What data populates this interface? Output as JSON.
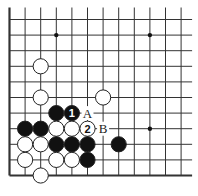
{
  "board": {
    "origin_x": 9.5,
    "origin_y": 19.5,
    "spacing": 15.6,
    "columns": 12,
    "rows": 11,
    "left_edge": true,
    "bottom_edge": true,
    "line_extend_top": 12,
    "line_extend_right": 11,
    "stone_radius": 7.6,
    "star_points": [
      {
        "c": 3,
        "r": 1
      },
      {
        "c": 9,
        "r": 1
      },
      {
        "c": 9,
        "r": 7
      }
    ],
    "stones": [
      {
        "c": 2,
        "r": 3,
        "color": "white"
      },
      {
        "c": 2,
        "r": 5,
        "color": "white"
      },
      {
        "c": 6,
        "r": 5,
        "color": "white"
      },
      {
        "c": 3,
        "r": 6,
        "color": "black"
      },
      {
        "c": 4,
        "r": 6,
        "color": "black",
        "label": "1"
      },
      {
        "c": 1,
        "r": 7,
        "color": "black"
      },
      {
        "c": 2,
        "r": 7,
        "color": "black"
      },
      {
        "c": 3,
        "r": 7,
        "color": "white"
      },
      {
        "c": 4,
        "r": 7,
        "color": "white"
      },
      {
        "c": 5,
        "r": 7,
        "color": "white",
        "label": "2"
      },
      {
        "c": 1,
        "r": 8,
        "color": "white"
      },
      {
        "c": 2,
        "r": 8,
        "color": "white"
      },
      {
        "c": 3,
        "r": 8,
        "color": "black"
      },
      {
        "c": 4,
        "r": 8,
        "color": "black"
      },
      {
        "c": 5,
        "r": 8,
        "color": "black"
      },
      {
        "c": 7,
        "r": 8,
        "color": "black"
      },
      {
        "c": 1,
        "r": 9,
        "color": "white"
      },
      {
        "c": 3,
        "r": 9,
        "color": "white"
      },
      {
        "c": 4,
        "r": 9,
        "color": "white"
      },
      {
        "c": 5,
        "r": 9,
        "color": "black"
      },
      {
        "c": 2,
        "r": 10,
        "color": "white"
      }
    ],
    "labels": [
      {
        "c": 5,
        "r": 6,
        "text": "A"
      },
      {
        "c": 6,
        "r": 7,
        "text": "B"
      }
    ]
  }
}
